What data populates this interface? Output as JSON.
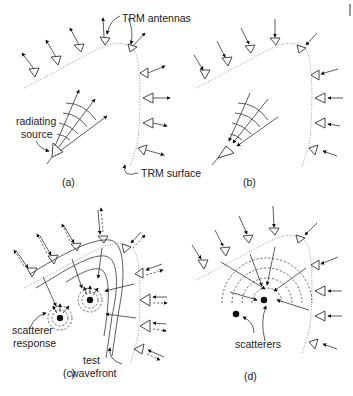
{
  "figure": {
    "panels": [
      {
        "id": "a",
        "caption": "(a)",
        "labels": [
          "TRM antennas",
          "radiating",
          "source",
          "TRM surface"
        ],
        "direction": "outgoing"
      },
      {
        "id": "b",
        "caption": "(b)",
        "labels": [],
        "direction": "incoming"
      },
      {
        "id": "c",
        "caption": "(c)",
        "labels": [
          "scatterer",
          "response",
          "test",
          "wavefront"
        ],
        "direction": "bidirectional"
      },
      {
        "id": "d",
        "caption": "(d)",
        "labels": [
          "scatterers"
        ],
        "direction": "incoming"
      }
    ],
    "colors": {
      "line": "#333333",
      "surface": "#9a9a9a",
      "background": "#ffffff"
    }
  }
}
